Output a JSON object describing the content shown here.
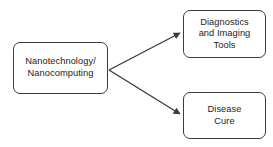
{
  "diagram": {
    "type": "flow-diagram",
    "background_color": "#ffffff",
    "stroke_color": "#3b3b3b",
    "text_color": "#1d1d1d",
    "nodes": {
      "source": {
        "label": "Nanotechnology/\nNanocomputing",
        "shape": "rounded-rectangle"
      },
      "diagnostics": {
        "label": "Diagnostics\nand Imaging\nTools",
        "shape": "rounded-rectangle"
      },
      "disease_cure": {
        "label": "Disease\nCure",
        "shape": "rounded-rectangle"
      }
    },
    "edges": [
      {
        "from": "source",
        "to": "diagnostics",
        "label": "",
        "arrowhead": "filled-triangle"
      },
      {
        "from": "source",
        "to": "disease_cure",
        "label": "",
        "arrowhead": "filled-triangle"
      }
    ]
  }
}
